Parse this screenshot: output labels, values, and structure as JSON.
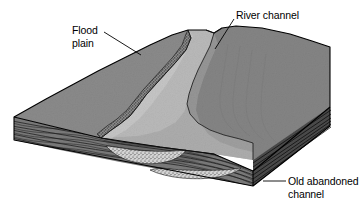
{
  "figure": {
    "type": "geological-block-diagram",
    "background_color": "#ffffff"
  },
  "labels": {
    "flood_plain": "Flood\nplain",
    "river_channel": "River channel",
    "old_abandoned_channel": "Old abandoned\nchannel"
  },
  "colors": {
    "top_surface": "#8a8a8a",
    "top_surface_dark": "#7e7e7e",
    "river_channel": "#b9b9b9",
    "river_channel_shadow": "#a3a3a3",
    "front_face": "#7a7a7a",
    "right_face": "#4d4d4d",
    "strata_line": "#1c1c1c",
    "outline": "#000000",
    "gravel_lens": "#cfcfcf",
    "label_text": "#000000",
    "leader_line": "#000000"
  },
  "parts": [
    {
      "name": "flood-plain-surface",
      "description": "Upper gray terrain surface on both sides of the river"
    },
    {
      "name": "river-channel-band",
      "description": "Light gray meandering river channel crossing the block surface"
    },
    {
      "name": "cut-bank-stipple",
      "description": "Stippled steep cut bank along the west side of the channel"
    },
    {
      "name": "front-cross-section",
      "description": "Front face of block showing wavy horizontal sedimentary strata"
    },
    {
      "name": "right-cross-section",
      "description": "Right shadowed face of block showing strata"
    },
    {
      "name": "active-channel-lens",
      "description": "Stippled gravel lens beneath the active river channel"
    },
    {
      "name": "old-abandoned-channel-lens",
      "description": "Stippled gravel lens of the buried abandoned channel"
    }
  ]
}
